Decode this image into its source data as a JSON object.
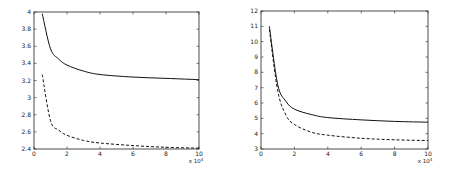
{
  "chart_data": [
    {
      "type": "line",
      "title": "",
      "xlabel": "",
      "ylabel": "",
      "x_multiplier": "x 10^4",
      "xlim": [
        0,
        10
      ],
      "ylim": [
        2.4,
        4
      ],
      "xticks": [
        "0",
        "2",
        "4",
        "6",
        "8",
        "10"
      ],
      "yticks": [
        "2.4",
        "2.6",
        "2.8",
        "3",
        "3.2",
        "3.4",
        "3.6",
        "3.8",
        "4"
      ],
      "grid": false,
      "legend": null,
      "x": [
        0.5,
        1,
        1.5,
        2,
        3,
        4,
        6,
        8,
        10
      ],
      "series": [
        {
          "name": "solid",
          "style": "solid",
          "values": [
            3.98,
            3.57,
            3.45,
            3.38,
            3.31,
            3.27,
            3.24,
            3.225,
            3.21
          ]
        },
        {
          "name": "dashed",
          "style": "dashed",
          "values": [
            3.27,
            2.73,
            2.62,
            2.56,
            2.5,
            2.47,
            2.44,
            2.42,
            2.41
          ]
        }
      ]
    },
    {
      "type": "line",
      "title": "",
      "xlabel": "",
      "ylabel": "",
      "x_multiplier": "x 10^4",
      "xlim": [
        0,
        10
      ],
      "ylim": [
        3,
        12
      ],
      "xticks": [
        "0",
        "2",
        "4",
        "6",
        "8",
        "10"
      ],
      "yticks": [
        "3",
        "4",
        "5",
        "6",
        "7",
        "8",
        "9",
        "10",
        "11",
        "12"
      ],
      "grid": false,
      "legend": null,
      "x": [
        0.5,
        1,
        1.5,
        2,
        3,
        4,
        6,
        8,
        10
      ],
      "series": [
        {
          "name": "solid",
          "style": "solid",
          "values": [
            11.0,
            7.2,
            6.1,
            5.6,
            5.25,
            5.05,
            4.9,
            4.8,
            4.75
          ]
        },
        {
          "name": "dashed",
          "style": "dashed",
          "values": [
            10.8,
            6.8,
            5.2,
            4.6,
            4.1,
            3.9,
            3.7,
            3.6,
            3.55
          ]
        }
      ]
    }
  ],
  "layout": [
    {
      "left": 34,
      "right": 199,
      "top": 12,
      "bottom": 149
    },
    {
      "left": 261,
      "right": 428,
      "top": 11,
      "bottom": 149
    }
  ]
}
